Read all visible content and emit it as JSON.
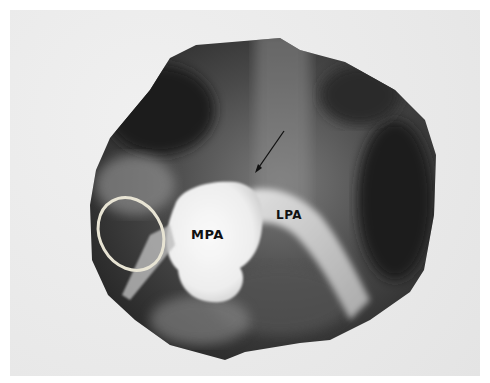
{
  "figure": {
    "type": "angiogram",
    "labels": {
      "mpa": "MPA",
      "lpa": "LPA"
    },
    "annotations": {
      "arrow": "arrow-pointer",
      "ellipse": "ring-marker"
    },
    "colors": {
      "background": "#ffffff",
      "panel": "#ececec",
      "film_dark": "#1c1c1c",
      "contrast_bright": "#f4f4f4",
      "ring": "#e8e4d4"
    }
  }
}
